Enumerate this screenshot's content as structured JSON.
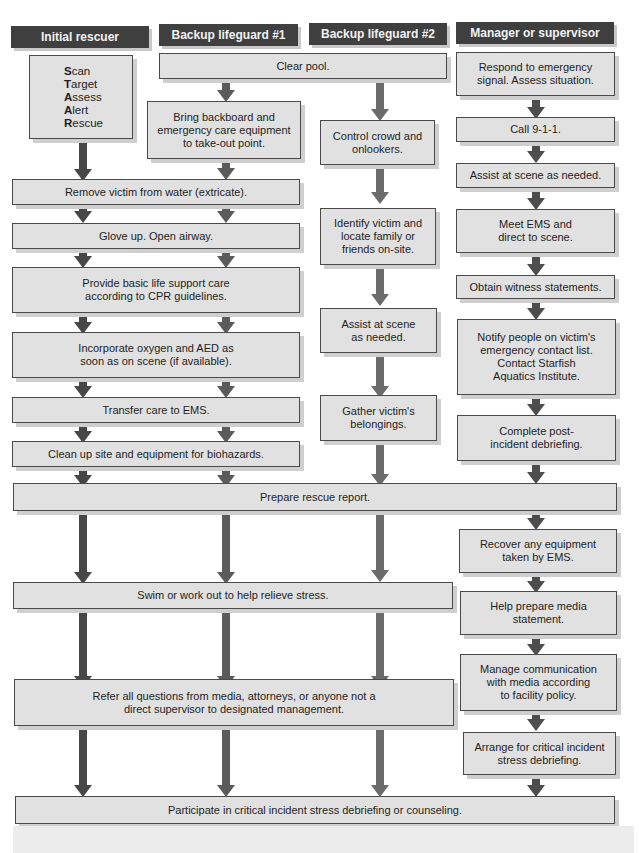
{
  "columns": [
    {
      "header": "Initial rescuer",
      "arrow_color": "#474747"
    },
    {
      "header": "Backup lifeguard #1",
      "arrow_color": "#5b5b5b"
    },
    {
      "header": "Backup lifeguard #2",
      "arrow_color": "#6b6b6b"
    },
    {
      "header": "Manager or supervisor",
      "arrow_color": "#4d4d4d"
    }
  ],
  "colors": {
    "header_bg": "#3f3f3f",
    "header_text": "#f2f2f2",
    "box_bg": "#e1e1e1",
    "box_border": "#4a4a4a"
  },
  "initial_rescuer": {
    "star": [
      {
        "initial": "S",
        "rest": "can"
      },
      {
        "initial": "T",
        "rest": "arget"
      },
      {
        "initial": "A",
        "rest": "ssess"
      },
      {
        "initial": "A",
        "rest": "lert"
      },
      {
        "initial": "R",
        "rest": "escue"
      }
    ]
  },
  "steps": {
    "clear_pool": "Clear pool.",
    "bring_backboard": "Bring backboard and\nemergency care equipment\nto take-out point.",
    "remove_victim": "Remove victim from water (extricate).",
    "glove_up": "Glove up. Open airway.",
    "basic_life_support": "Provide basic life support care\naccording to CPR guidelines.",
    "oxygen_aed": "Incorporate oxygen and AED as\nsoon as on scene (if available).",
    "transfer_care": "Transfer care to EMS.",
    "clean_up": "Clean up site and equipment for biohazards.",
    "control_crowd": "Control crowd and\nonlookers.",
    "identify_victim": "Identify victim and\nlocate family or\nfriends on-site.",
    "assist_scene_bg2": "Assist at scene\nas needed.",
    "gather_belongings": "Gather victim's\nbelongings.",
    "respond_signal": "Respond to emergency\nsignal. Assess situation.",
    "call_911": "Call 9-1-1.",
    "assist_scene_mgr": "Assist at scene as needed.",
    "meet_ems": "Meet EMS and\ndirect to scene.",
    "witness_statements": "Obtain witness statements.",
    "notify_people": "Notify people on victim's\nemergency contact list.\nContact Starfish\nAquatics Institute.",
    "complete_debrief": "Complete post-\nincident debriefing.",
    "prepare_report": "Prepare rescue report.",
    "recover_equipment": "Recover any equipment\ntaken by EMS.",
    "swim_workout": "Swim or work out to help relieve stress.",
    "media_statement": "Help prepare media\nstatement.",
    "manage_communication": "Manage communication\nwith media according\nto facility policy.",
    "refer_questions": "Refer all questions from media, attorneys, or anyone not a\ndirect supervisor to designated management.",
    "arrange_cisd": "Arrange for critical incident\nstress debriefing.",
    "participate_cisd": "Participate in critical incident stress debriefing or counseling."
  }
}
